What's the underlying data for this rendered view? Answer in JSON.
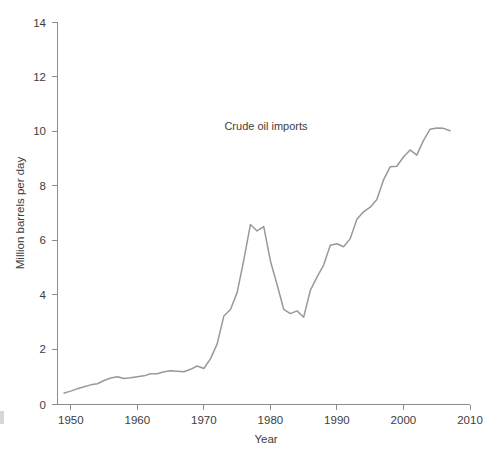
{
  "chart_data": {
    "type": "line",
    "title": "",
    "annotation": "Crude oil imports",
    "xlabel": "Year",
    "ylabel": "Million barrels per day",
    "xlim": [
      1948,
      2010
    ],
    "ylim": [
      0,
      14
    ],
    "xticks": [
      1950,
      1960,
      1970,
      1980,
      1990,
      2000,
      2010
    ],
    "xtick_labels": [
      "1950",
      "1960",
      "1970",
      "1980",
      "1990",
      "2000",
      "2010"
    ],
    "yticks": [
      0,
      2,
      4,
      6,
      8,
      10,
      12,
      14
    ],
    "ytick_labels": [
      "0",
      "2",
      "4",
      "6",
      "8",
      "10",
      "12",
      "14"
    ],
    "grid": false,
    "legend_position": "none",
    "line_color": "#999999",
    "series": [
      {
        "name": "Crude oil imports",
        "x": [
          1949,
          1950,
          1951,
          1952,
          1953,
          1954,
          1955,
          1956,
          1957,
          1958,
          1959,
          1960,
          1961,
          1962,
          1963,
          1964,
          1965,
          1966,
          1967,
          1968,
          1969,
          1970,
          1971,
          1972,
          1973,
          1974,
          1975,
          1976,
          1977,
          1978,
          1979,
          1980,
          1981,
          1982,
          1983,
          1984,
          1985,
          1986,
          1987,
          1988,
          1989,
          1990,
          1991,
          1992,
          1993,
          1994,
          1995,
          1996,
          1997,
          1998,
          1999,
          2000,
          2001,
          2002,
          2003,
          2004,
          2005,
          2006,
          2007
        ],
        "y": [
          0.42,
          0.49,
          0.58,
          0.65,
          0.72,
          0.76,
          0.88,
          0.97,
          1.02,
          0.95,
          0.98,
          1.02,
          1.05,
          1.13,
          1.13,
          1.2,
          1.24,
          1.22,
          1.2,
          1.29,
          1.41,
          1.32,
          1.68,
          2.22,
          3.24,
          3.48,
          4.1,
          5.29,
          6.6,
          6.36,
          6.52,
          5.26,
          4.4,
          3.49,
          3.33,
          3.43,
          3.2,
          4.18,
          4.67,
          5.11,
          5.84,
          5.89,
          5.78,
          6.08,
          6.79,
          7.06,
          7.23,
          7.51,
          8.23,
          8.71,
          8.73,
          9.07,
          9.33,
          9.14,
          9.67,
          10.09,
          10.13,
          10.12,
          10.03
        ],
        "values_note": "Million barrels per day"
      }
    ]
  },
  "axes": {
    "y_axis_title": "Million barrels per day",
    "x_axis_title": "Year"
  },
  "annotation": {
    "text": "Crude oil imports"
  }
}
